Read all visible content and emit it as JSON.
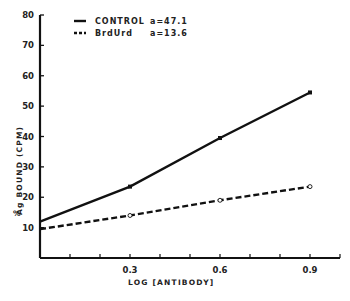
{
  "chart_data": {
    "type": "line",
    "title": "",
    "xlabel": "LOG [ANTIBODY]",
    "ylabel": "% Ag BOUND (CPM)",
    "xlim": [
      0,
      1.0
    ],
    "ylim": [
      0,
      80
    ],
    "x_tick_labels": [
      "0.3",
      "0.6",
      "0.9"
    ],
    "x_minor_ticks": [
      0.1,
      0.2,
      0.3,
      0.4,
      0.5,
      0.6,
      0.7,
      0.8,
      0.9,
      1.0
    ],
    "y_ticks": [
      10,
      20,
      30,
      40,
      50,
      60,
      70,
      80
    ],
    "grid": false,
    "legend_position": "top",
    "x": [
      0,
      0.3,
      0.6,
      0.9
    ],
    "series": [
      {
        "name": "CONTROL",
        "annotation": "a=47.1",
        "line_style": "solid",
        "marker": "filled-square",
        "values": [
          12,
          23.5,
          39.5,
          54.5
        ]
      },
      {
        "name": "BrdUrd",
        "annotation": "a=13.6",
        "line_style": "dashed",
        "marker": "open-circle",
        "values": [
          9.5,
          14,
          19,
          23.5
        ]
      }
    ]
  },
  "legend": {
    "items": [
      {
        "label": "CONTROL",
        "value": "a=47.1"
      },
      {
        "label": "BrdUrd",
        "value": "a=13.6"
      }
    ]
  },
  "axes": {
    "x_title": "LOG [ANTIBODY]",
    "y_title_pct": "%",
    "y_title_main": "Ag  BOUND (CPM)"
  }
}
